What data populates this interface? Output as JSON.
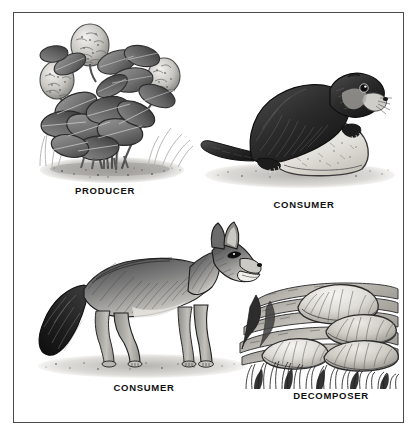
{
  "figure": {
    "background_color": "#ffffff",
    "border_color": "#4a4a4a",
    "style": "grayscale pen-and-ink illustration"
  },
  "panels": [
    {
      "id": "producer",
      "caption": "PRODUCER",
      "subject": "clover-plant",
      "subject_description": "Clover plant with three round flower heads, trifoliate leaves, grass and soil at base",
      "position": "top-left",
      "caption_x": 104,
      "caption_y": 185
    },
    {
      "id": "consumer-marmot",
      "caption": "CONSUMER",
      "subject": "marmot-on-rock",
      "subject_description": "Marmot or prairie dog resting on a pale boulder, facing right",
      "position": "top-right",
      "caption_x": 303,
      "caption_y": 200
    },
    {
      "id": "consumer-coyote",
      "caption": "CONSUMER",
      "subject": "coyote",
      "subject_description": "Coyote standing in profile facing right with open mouth and bushy tail",
      "position": "bottom-left",
      "caption_x": 143,
      "caption_y": 382
    },
    {
      "id": "decomposer",
      "caption": "DECOMPOSER",
      "subject": "bracket-fungi-on-log",
      "subject_description": "Overlapping shelf fungi growing on a decaying layered log above grass",
      "position": "bottom-right",
      "caption_x": 330,
      "caption_y": 390
    }
  ],
  "colors": {
    "ink_dark": "#1b1b1b",
    "ink_mid": "#6d6d6d",
    "ink_light": "#b4b4b4",
    "fill_pale": "#e8e6e1",
    "caption_color": "#111111"
  }
}
